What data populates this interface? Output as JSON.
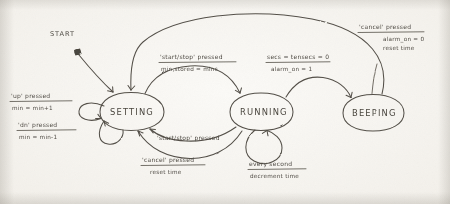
{
  "diagram": {
    "kind": "hand-drawn finite state machine",
    "start_marker_label": "START",
    "states": [
      {
        "id": "setting",
        "label": "SETTING"
      },
      {
        "id": "running",
        "label": "RUNNING"
      },
      {
        "id": "beeping",
        "label": "BEEPING"
      }
    ],
    "transitions": [
      {
        "id": "t-start",
        "from": "START",
        "to": "SETTING",
        "condition": "",
        "action": ""
      },
      {
        "id": "t-setting-up",
        "from": "SETTING",
        "to": "SETTING",
        "condition": "'up' pressed",
        "action": "min = min+1"
      },
      {
        "id": "t-setting-dn",
        "from": "SETTING",
        "to": "SETTING",
        "condition": "'dn' pressed",
        "action": "min = min-1"
      },
      {
        "id": "t-setting-running",
        "from": "SETTING",
        "to": "RUNNING",
        "condition": "'start/stop' pressed",
        "action": "min_stored = mins"
      },
      {
        "id": "t-running-setting-startstop",
        "from": "RUNNING",
        "to": "SETTING",
        "condition": "'start/stop' pressed",
        "action": ""
      },
      {
        "id": "t-running-setting-cancel",
        "from": "RUNNING",
        "to": "SETTING",
        "condition": "'cancel' pressed",
        "action": "reset time"
      },
      {
        "id": "t-running-tick",
        "from": "RUNNING",
        "to": "RUNNING",
        "condition": "every second",
        "action": "decrement time"
      },
      {
        "id": "t-running-beeping",
        "from": "RUNNING",
        "to": "BEEPING",
        "condition": "secs = tensecs = 0",
        "action": "alarm_on = 1"
      },
      {
        "id": "t-beeping-setting",
        "from": "BEEPING",
        "to": "SETTING",
        "condition": "'cancel' pressed",
        "action": "alarm_on = 0",
        "action2": "reset time"
      }
    ],
    "labels": {
      "start": "START",
      "setting": "SETTING",
      "running": "RUNNING",
      "beeping": "BEEPING",
      "up_cond": "'up' pressed",
      "up_act": "min = min+1",
      "dn_cond": "'dn' pressed",
      "dn_act": "min = min-1",
      "startstop_cond": "'start/stop' pressed",
      "startstop_act": "min,stored = mins",
      "startstop_back_cond": "'start/stop' pressed",
      "cancel_cond": "'cancel' pressed",
      "cancel_act": "reset time",
      "tick_cond": "every second",
      "tick_act": "decrement time",
      "timeout_cond": "secs = tensecs = 0",
      "timeout_act": "alarm_on = 1",
      "beep_cancel_cond": "'cancel' pressed",
      "beep_cancel_act": "alarm_on = 0",
      "beep_cancel_act2": "reset time"
    },
    "colors": {
      "ink": "#545049",
      "paper": "#f3f1ec",
      "ink_dark": "#4a463f"
    }
  }
}
